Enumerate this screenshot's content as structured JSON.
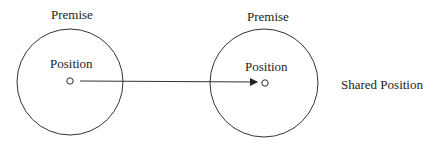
{
  "diagram": {
    "left": {
      "title": "Premise",
      "inner_label": "Position"
    },
    "right": {
      "title": "Premise",
      "inner_label": "Position"
    },
    "shared_label": "Shared Position",
    "stroke_color": "#333333"
  }
}
